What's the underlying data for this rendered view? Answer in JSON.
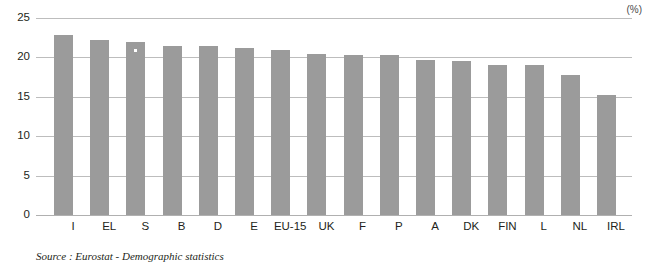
{
  "chart_data": {
    "type": "bar",
    "title": "",
    "subtitle": "",
    "unit_label": "(%)",
    "xlabel": "",
    "ylabel": "",
    "ylim": [
      0,
      25
    ],
    "ytick_values": [
      0,
      5,
      10,
      15,
      20,
      25
    ],
    "ytick_labels": [
      "0",
      "5",
      "10",
      "15",
      "20",
      "25"
    ],
    "grid": true,
    "legend": null,
    "legend_position": "none",
    "orientation": "vertical",
    "bar_color": "#9b9b9b",
    "categories": [
      "I",
      "EL",
      "S",
      "B",
      "D",
      "E",
      "EU-15",
      "UK",
      "F",
      "P",
      "A",
      "DK",
      "FIN",
      "L",
      "NL",
      "IRL"
    ],
    "values": [
      22.8,
      22.2,
      22.0,
      21.5,
      21.4,
      21.2,
      21.0,
      20.4,
      20.3,
      20.3,
      19.7,
      19.6,
      19.1,
      19.0,
      17.8,
      15.2
    ],
    "series": [
      {
        "name": "",
        "values": [
          22.8,
          22.2,
          22.0,
          21.5,
          21.4,
          21.2,
          21.0,
          20.4,
          20.3,
          20.3,
          19.7,
          19.6,
          19.1,
          19.0,
          17.8,
          15.2
        ]
      }
    ],
    "annotations": []
  },
  "source_note": "Source : Eurostat - Demographic statistics"
}
